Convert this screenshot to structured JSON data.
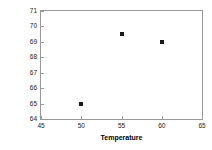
{
  "chart_data": {
    "type": "scatter",
    "title": "",
    "xlabel": "Temperature",
    "ylabel": "Yield",
    "xlim": [
      45,
      65
    ],
    "ylim": [
      64,
      71
    ],
    "xticks": [
      45,
      50,
      55,
      60,
      65
    ],
    "yticks": [
      64,
      65,
      66,
      67,
      68,
      69,
      70,
      71
    ],
    "xtick_labels": [
      "45",
      "50",
      "55",
      "60",
      "65"
    ],
    "ytick_labels": [
      "64",
      "65",
      "66",
      "67",
      "68",
      "69",
      "70",
      "71"
    ],
    "grid": false,
    "legend": null,
    "series": [
      {
        "name": "Yield vs Temperature",
        "marker": "square",
        "color": "#1a1a1a",
        "points": [
          {
            "x": 50,
            "y": 65.0
          },
          {
            "x": 55,
            "y": 69.5
          },
          {
            "x": 60,
            "y": 69.0
          }
        ]
      }
    ],
    "frame_color": "#9a9a9a",
    "background": "#ffffff"
  }
}
